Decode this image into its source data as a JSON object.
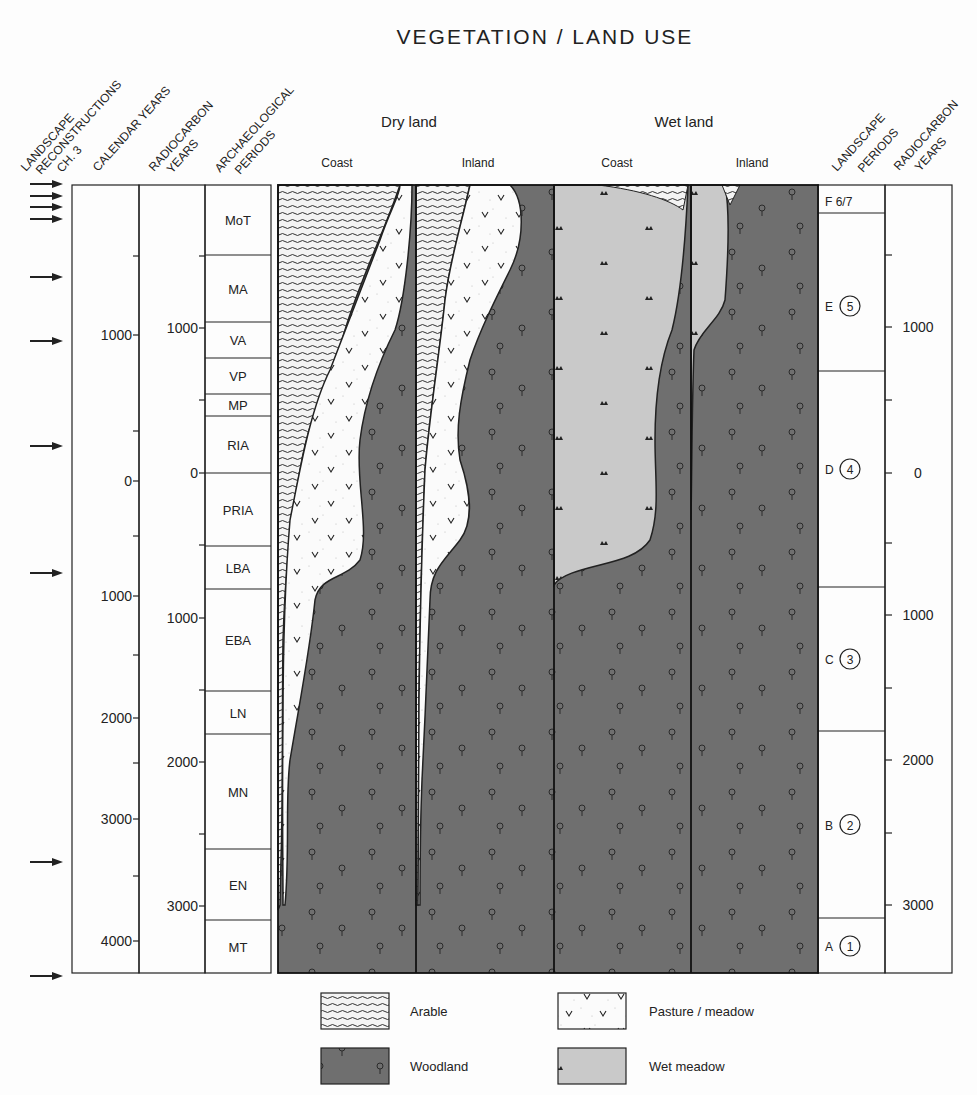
{
  "title": "VEGETATION / LAND USE",
  "group_headers": {
    "dry_land": "Dry land",
    "wet_land": "Wet land"
  },
  "column_headers": {
    "dry_coast": "Coast",
    "dry_inland": "Inland",
    "wet_coast": "Coast",
    "wet_inland": "Inland"
  },
  "rotated_headers": {
    "landscape_recon": [
      "LANDSCAPE",
      "RECONSTRUCTIONS",
      "CH. 3"
    ],
    "calendar_years": [
      "CALENDAR YEARS"
    ],
    "radiocarbon_left": [
      "RADIOCARBON",
      "YEARS"
    ],
    "arch_periods": [
      "ARCHAEOLOGICAL",
      "PERIODS"
    ],
    "landscape_periods": [
      "LANDSCAPE",
      "PERIODS"
    ],
    "radiocarbon_right": [
      "RADIOCARBON",
      "YEARS"
    ]
  },
  "calendar_ticks": [
    {
      "label": "1000",
      "y": 335
    },
    {
      "label": "0",
      "y": 481
    },
    {
      "label": "1000",
      "y": 596
    },
    {
      "label": "2000",
      "y": 718
    },
    {
      "label": "3000",
      "y": 819
    },
    {
      "label": "4000",
      "y": 941
    }
  ],
  "calendar_minor_ticks": [
    256,
    431,
    536,
    655,
    763,
    876
  ],
  "radiocarbon_left_ticks": [
    {
      "label": "1000",
      "y": 328
    },
    {
      "label": "0",
      "y": 473
    },
    {
      "label": "1000",
      "y": 618
    },
    {
      "label": "2000",
      "y": 762
    },
    {
      "label": "3000",
      "y": 906
    }
  ],
  "radiocarbon_left_minor_ticks": [
    256,
    400,
    545,
    690,
    834
  ],
  "arch_periods": [
    {
      "label": "MoT",
      "y0": 185,
      "y1": 255
    },
    {
      "label": "MA",
      "y0": 255,
      "y1": 322
    },
    {
      "label": "VA",
      "y0": 322,
      "y1": 358
    },
    {
      "label": "VP",
      "y0": 358,
      "y1": 394
    },
    {
      "label": "MP",
      "y0": 394,
      "y1": 416
    },
    {
      "label": "RIA",
      "y0": 416,
      "y1": 473
    },
    {
      "label": "PRIA",
      "y0": 473,
      "y1": 546
    },
    {
      "label": "LBA",
      "y0": 546,
      "y1": 589
    },
    {
      "label": "EBA",
      "y0": 589,
      "y1": 691
    },
    {
      "label": "LN",
      "y0": 691,
      "y1": 734
    },
    {
      "label": "MN",
      "y0": 734,
      "y1": 849
    },
    {
      "label": "EN",
      "y0": 849,
      "y1": 920
    },
    {
      "label": "MT",
      "y0": 920,
      "y1": 973
    }
  ],
  "landscape_periods": [
    {
      "letter": "F",
      "num": "6/7",
      "circled": false,
      "y0": 185,
      "y1": 213
    },
    {
      "letter": "E",
      "num": "5",
      "circled": true,
      "y0": 213,
      "y1": 371
    },
    {
      "letter": "D",
      "num": "4",
      "circled": true,
      "y0": 371,
      "y1": 587
    },
    {
      "letter": "C",
      "num": "3",
      "circled": true,
      "y0": 587,
      "y1": 731
    },
    {
      "letter": "B",
      "num": "2",
      "circled": true,
      "y0": 731,
      "y1": 918
    },
    {
      "letter": "A",
      "num": "1",
      "circled": true,
      "y0": 918,
      "y1": 973
    }
  ],
  "radiocarbon_right_ticks": [
    {
      "label": "1000",
      "y": 327
    },
    {
      "label": "0",
      "y": 473
    },
    {
      "label": "1000",
      "y": 615
    },
    {
      "label": "2000",
      "y": 760
    },
    {
      "label": "3000",
      "y": 905
    }
  ],
  "radiocarbon_right_minor_ticks": [
    255,
    400,
    543,
    688,
    833
  ],
  "reconstruction_arrows_y": [
    184,
    196,
    207,
    219,
    277,
    341,
    446,
    573,
    862,
    976
  ],
  "legend": [
    {
      "label": "Arable",
      "pattern": "arable"
    },
    {
      "label": "Pasture / meadow",
      "pattern": "pasture"
    },
    {
      "label": "Woodland",
      "pattern": "woodland"
    },
    {
      "label": "Wet meadow",
      "pattern": "wetmeadow"
    }
  ],
  "colors": {
    "woodland": "#6f6f6f",
    "wet_meadow": "#c9c9c9",
    "pasture": "#fbfbfb",
    "arable_bg": "#f4f4f4",
    "ink": "#222222"
  }
}
